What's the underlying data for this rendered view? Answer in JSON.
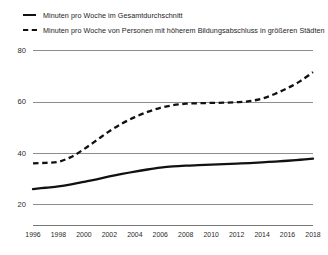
{
  "chart_data": {
    "type": "line",
    "title": "",
    "subtitle": "",
    "xlabel": "",
    "ylabel": "",
    "xlim": [
      1996,
      2018
    ],
    "ylim": [
      12,
      84
    ],
    "yticks": [
      20,
      40,
      60,
      80
    ],
    "ytick_labels": [
      "20",
      "40",
      "60",
      "80"
    ],
    "grid": "horizontal",
    "legend_position": "top-left",
    "categories": [
      1996,
      1997,
      1998,
      1999,
      2000,
      2001,
      2002,
      2003,
      2004,
      2005,
      2006,
      2007,
      2008,
      2009,
      2010,
      2011,
      2012,
      2013,
      2014,
      2015,
      2016,
      2017,
      2018
    ],
    "xtick_labels": [
      "1996",
      "1998",
      "2000",
      "2002",
      "2004",
      "2006",
      "2008",
      "2010",
      "2012",
      "2014",
      "2016",
      "2018"
    ],
    "series": [
      {
        "name": "Minuten pro Woche im Gesamtdurchschnitt",
        "style": "solid",
        "color": "#111111",
        "values": [
          26,
          26.5,
          27,
          27.8,
          28.8,
          29.8,
          30.9,
          31.9,
          32.8,
          33.6,
          34.3,
          34.8,
          35.1,
          35.3,
          35.5,
          35.7,
          35.9,
          36.1,
          36.4,
          36.7,
          37.0,
          37.4,
          37.8
        ]
      },
      {
        "name": "Minuten pro Woche von Personen mit höherem Bildungsabschluss in größeren Städten",
        "style": "dashed",
        "color": "#111111",
        "values": [
          36,
          36.2,
          36.6,
          38.5,
          41.5,
          45.0,
          48.5,
          51.5,
          54.0,
          56.0,
          57.6,
          58.6,
          59.2,
          59.4,
          59.5,
          59.6,
          59.8,
          60.2,
          61.2,
          63.0,
          65.3,
          68.0,
          71.5
        ]
      }
    ]
  },
  "legend": {
    "items": [
      {
        "label": "Minuten pro Woche im Gesamtdurchschnitt",
        "style": "solid"
      },
      {
        "label": "Minuten pro Woche von Personen mit höherem Bildungsabschluss in größeren Städten",
        "style": "dashed"
      }
    ]
  }
}
